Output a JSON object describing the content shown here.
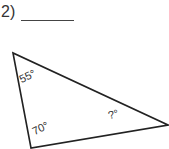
{
  "problem": {
    "number": "2)",
    "answer_blank": ""
  },
  "triangle": {
    "angles": [
      {
        "vertex": "top-left",
        "label": "55°"
      },
      {
        "vertex": "bottom-left",
        "label": "70°"
      },
      {
        "vertex": "right",
        "label": "?°"
      }
    ],
    "stroke_color": "#222222"
  }
}
